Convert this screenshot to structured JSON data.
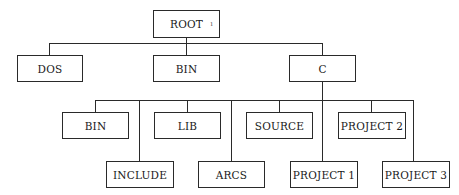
{
  "diagram": {
    "type": "directory-tree",
    "root": {
      "label": "ROOT",
      "marker": "ı"
    },
    "level1": [
      {
        "label": "DOS"
      },
      {
        "label": "BIN"
      },
      {
        "label": "C"
      }
    ],
    "level2_upper": [
      {
        "label": "BIN"
      },
      {
        "label": "LIB"
      },
      {
        "label": "SOURCE"
      },
      {
        "label": "PROJECT 2"
      }
    ],
    "level2_lower": [
      {
        "label": "INCLUDE"
      },
      {
        "label": "ARCS"
      },
      {
        "label": "PROJECT 1"
      },
      {
        "label": "PROJECT 3"
      }
    ],
    "edges": [
      [
        "ROOT",
        "DOS"
      ],
      [
        "ROOT",
        "BIN"
      ],
      [
        "ROOT",
        "C"
      ],
      [
        "C",
        "BIN"
      ],
      [
        "C",
        "LIB"
      ],
      [
        "C",
        "SOURCE"
      ],
      [
        "C",
        "PROJECT 2"
      ],
      [
        "C",
        "INCLUDE"
      ],
      [
        "C",
        "ARCS"
      ],
      [
        "C",
        "PROJECT 1"
      ],
      [
        "C",
        "PROJECT 3"
      ]
    ]
  }
}
